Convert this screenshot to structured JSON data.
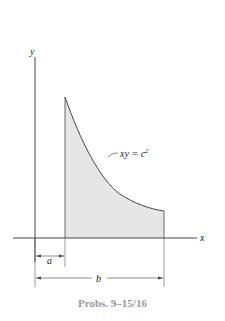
{
  "figure": {
    "caption": "Probs. 9–15/16",
    "axes": {
      "x_label": "x",
      "y_label": "y"
    },
    "curve": {
      "equation_lhs": "xy = c",
      "equation_exponent": "2"
    },
    "dimensions": {
      "a_label": "a",
      "b_label": "b"
    },
    "colors": {
      "shade": "#e6e6e6",
      "line": "#333333",
      "caption": "#9a9a9a"
    }
  }
}
